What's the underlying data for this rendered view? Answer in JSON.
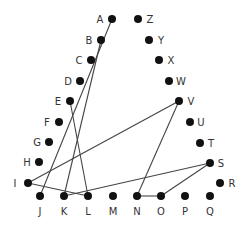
{
  "nodes": [
    {
      "id": "A",
      "x": 112,
      "y": 19,
      "lx": 100,
      "ly": 23,
      "anchor": "middle"
    },
    {
      "id": "B",
      "x": 101,
      "y": 40,
      "lx": 89,
      "ly": 44,
      "anchor": "middle"
    },
    {
      "id": "C",
      "x": 91,
      "y": 60,
      "lx": 79,
      "ly": 64,
      "anchor": "middle"
    },
    {
      "id": "D",
      "x": 80,
      "y": 81,
      "lx": 68,
      "ly": 85,
      "anchor": "middle"
    },
    {
      "id": "E",
      "x": 70,
      "y": 101,
      "lx": 58,
      "ly": 105,
      "anchor": "middle"
    },
    {
      "id": "F",
      "x": 59,
      "y": 122,
      "lx": 47,
      "ly": 126,
      "anchor": "middle"
    },
    {
      "id": "G",
      "x": 49,
      "y": 142,
      "lx": 37,
      "ly": 146,
      "anchor": "middle"
    },
    {
      "id": "H",
      "x": 39,
      "y": 162,
      "lx": 27,
      "ly": 166,
      "anchor": "middle"
    },
    {
      "id": "I",
      "x": 28,
      "y": 183,
      "lx": 15,
      "ly": 187,
      "anchor": "middle"
    },
    {
      "id": "J",
      "x": 40,
      "y": 196,
      "lx": 40,
      "ly": 215,
      "anchor": "middle"
    },
    {
      "id": "K",
      "x": 64,
      "y": 196,
      "lx": 64,
      "ly": 215,
      "anchor": "middle"
    },
    {
      "id": "L",
      "x": 88,
      "y": 196,
      "lx": 88,
      "ly": 215,
      "anchor": "middle"
    },
    {
      "id": "M",
      "x": 113,
      "y": 196,
      "lx": 113,
      "ly": 215,
      "anchor": "middle"
    },
    {
      "id": "N",
      "x": 137,
      "y": 196,
      "lx": 137,
      "ly": 215,
      "anchor": "middle"
    },
    {
      "id": "O",
      "x": 161,
      "y": 196,
      "lx": 161,
      "ly": 215,
      "anchor": "middle"
    },
    {
      "id": "P",
      "x": 185,
      "y": 196,
      "lx": 185,
      "ly": 215,
      "anchor": "middle"
    },
    {
      "id": "Q",
      "x": 210,
      "y": 196,
      "lx": 210,
      "ly": 215,
      "anchor": "middle"
    },
    {
      "id": "R",
      "x": 220,
      "y": 183,
      "lx": 232,
      "ly": 187,
      "anchor": "middle"
    },
    {
      "id": "S",
      "x": 210,
      "y": 163,
      "lx": 221,
      "ly": 167,
      "anchor": "middle"
    },
    {
      "id": "T",
      "x": 200,
      "y": 143,
      "lx": 211,
      "ly": 147,
      "anchor": "middle"
    },
    {
      "id": "U",
      "x": 190,
      "y": 122,
      "lx": 201,
      "ly": 126,
      "anchor": "middle"
    },
    {
      "id": "V",
      "x": 179,
      "y": 101,
      "lx": 191,
      "ly": 105,
      "anchor": "middle"
    },
    {
      "id": "W",
      "x": 169,
      "y": 81,
      "lx": 181,
      "ly": 85,
      "anchor": "middle"
    },
    {
      "id": "X",
      "x": 159,
      "y": 60,
      "lx": 171,
      "ly": 64,
      "anchor": "middle"
    },
    {
      "id": "Y",
      "x": 149,
      "y": 40,
      "lx": 161,
      "ly": 44,
      "anchor": "middle"
    },
    {
      "id": "Z",
      "x": 138,
      "y": 19,
      "lx": 150,
      "ly": 23,
      "anchor": "middle"
    }
  ],
  "edges": [
    [
      "A",
      "J"
    ],
    [
      "B",
      "K"
    ],
    [
      "E",
      "L"
    ],
    [
      "I",
      "V"
    ],
    [
      "I",
      "L"
    ],
    [
      "K",
      "S"
    ],
    [
      "V",
      "N"
    ],
    [
      "N",
      "O"
    ],
    [
      "O",
      "S"
    ]
  ],
  "colors": {
    "node": "#111111",
    "edge": "#444444",
    "label": "#333333"
  }
}
